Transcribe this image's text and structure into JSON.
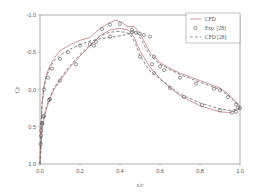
{
  "chart_data": {
    "type": "line",
    "title": "",
    "xlabel": "x/c",
    "ylabel": "Cp",
    "xlim": [
      0.0,
      1.0
    ],
    "ylim": [
      1.0,
      -1.0
    ],
    "y_inverted": true,
    "grid": false,
    "legend_position": "upper right",
    "x_ticks": [
      "0.0",
      "0.2",
      "0.4",
      "0.6",
      "0.8",
      "1.0"
    ],
    "y_ticks": [
      "-1.0",
      "-0.5",
      "0.0",
      "0.5",
      "1.0"
    ],
    "legend": [
      "CFD",
      "Exp. [28]",
      "CFD [28]"
    ],
    "series": [
      {
        "name": "CFD",
        "style": "solid",
        "color": "#c77b7b",
        "upper": {
          "x": [
            0.0,
            0.005,
            0.01,
            0.02,
            0.03,
            0.05,
            0.07,
            0.1,
            0.15,
            0.2,
            0.25,
            0.3,
            0.35,
            0.38,
            0.41,
            0.44,
            0.47,
            0.5,
            0.55,
            0.6,
            0.65,
            0.7,
            0.8,
            0.9,
            0.95,
            1.0
          ],
          "y": [
            1.0,
            0.5,
            0.2,
            -0.05,
            -0.18,
            -0.32,
            -0.42,
            -0.52,
            -0.6,
            -0.66,
            -0.7,
            -0.82,
            -0.9,
            -0.93,
            -0.9,
            -0.84,
            -0.85,
            -0.75,
            -0.5,
            -0.36,
            -0.28,
            -0.22,
            -0.12,
            -0.02,
            0.08,
            0.22
          ]
        },
        "lower": {
          "x": [
            0.0,
            0.01,
            0.02,
            0.03,
            0.05,
            0.07,
            0.1,
            0.15,
            0.2,
            0.25,
            0.3,
            0.35,
            0.4,
            0.44,
            0.47,
            0.5,
            0.55,
            0.6,
            0.65,
            0.7,
            0.8,
            0.9,
            0.95,
            1.0
          ],
          "y": [
            1.0,
            0.55,
            0.4,
            0.28,
            0.12,
            0.0,
            -0.12,
            -0.3,
            -0.45,
            -0.58,
            -0.72,
            -0.8,
            -0.82,
            -0.8,
            -0.7,
            -0.52,
            -0.3,
            -0.15,
            -0.02,
            0.08,
            0.22,
            0.3,
            0.31,
            0.25
          ]
        }
      },
      {
        "name": "Exp. [28]",
        "style": "marker-circle",
        "color": "#555555",
        "x": [
          0.003,
          0.005,
          0.01,
          0.015,
          0.02,
          0.04,
          0.06,
          0.1,
          0.14,
          0.2,
          0.25,
          0.28,
          0.31,
          0.35,
          0.4,
          0.46,
          0.48,
          0.5,
          0.52,
          0.55,
          0.57,
          0.6,
          0.62,
          0.7,
          0.78,
          0.87,
          0.9,
          0.94,
          0.98,
          0.99,
          1.0,
          0.98,
          0.96,
          0.9,
          0.81,
          0.72,
          0.65,
          0.57,
          0.56,
          0.5,
          0.46,
          0.35,
          0.27,
          0.18,
          0.1,
          0.05,
          0.045,
          0.02,
          0.01,
          0.005
        ],
        "y": [
          0.73,
          0.55,
          0.45,
          0.36,
          0.0,
          -0.16,
          -0.28,
          -0.41,
          -0.5,
          -0.59,
          -0.61,
          -0.64,
          -0.81,
          -0.87,
          -0.88,
          -0.8,
          -0.76,
          -0.75,
          -0.73,
          -0.71,
          -0.44,
          -0.31,
          -0.26,
          -0.16,
          -0.08,
          -0.01,
          0.01,
          0.1,
          0.2,
          0.24,
          0.25,
          0.3,
          0.31,
          0.28,
          0.21,
          0.1,
          -0.02,
          -0.22,
          -0.34,
          -0.44,
          -0.77,
          -0.71,
          -0.59,
          -0.34,
          -0.12,
          0.13,
          0.14,
          0.36,
          0.46,
          0.62
        ]
      },
      {
        "name": "CFD [28]",
        "style": "dashed",
        "color": "#6b6b6b",
        "upper": {
          "x": [
            0.0,
            0.005,
            0.01,
            0.02,
            0.03,
            0.05,
            0.07,
            0.1,
            0.15,
            0.2,
            0.25,
            0.3,
            0.35,
            0.4,
            0.45,
            0.48,
            0.5,
            0.55,
            0.6,
            0.65,
            0.7,
            0.8,
            0.9,
            0.95,
            1.0
          ],
          "y": [
            1.0,
            0.5,
            0.2,
            -0.02,
            -0.15,
            -0.3,
            -0.38,
            -0.46,
            -0.54,
            -0.6,
            -0.65,
            -0.68,
            -0.7,
            -0.72,
            -0.75,
            -0.78,
            -0.7,
            -0.46,
            -0.34,
            -0.27,
            -0.2,
            -0.1,
            0.0,
            0.1,
            0.24
          ]
        },
        "lower": {
          "x": [
            0.0,
            0.01,
            0.02,
            0.03,
            0.05,
            0.07,
            0.1,
            0.15,
            0.2,
            0.25,
            0.3,
            0.35,
            0.4,
            0.45,
            0.48,
            0.5,
            0.55,
            0.6,
            0.65,
            0.7,
            0.8,
            0.9,
            0.95,
            1.0
          ],
          "y": [
            1.0,
            0.5,
            0.36,
            0.25,
            0.1,
            -0.02,
            -0.14,
            -0.32,
            -0.47,
            -0.6,
            -0.72,
            -0.77,
            -0.78,
            -0.75,
            -0.6,
            -0.45,
            -0.25,
            -0.14,
            -0.04,
            0.06,
            0.18,
            0.26,
            0.28,
            0.26
          ]
        }
      }
    ]
  },
  "plot_area": {
    "left": 40,
    "top": 15,
    "right": 240,
    "bottom": 164
  }
}
